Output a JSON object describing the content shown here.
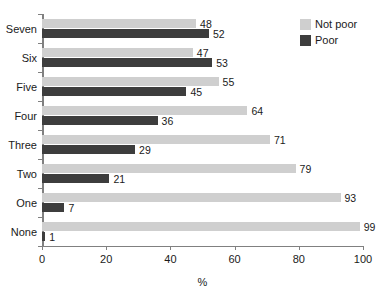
{
  "chart_data": {
    "type": "bar",
    "orientation": "horizontal",
    "title": "",
    "xlabel": "%",
    "ylabel": "",
    "xlim": [
      0,
      100
    ],
    "xticks": [
      0,
      20,
      40,
      60,
      80,
      100
    ],
    "grid": false,
    "legend_position": "top-right",
    "categories": [
      "Seven",
      "Six",
      "Five",
      "Four",
      "Three",
      "Two",
      "One",
      "None"
    ],
    "series": [
      {
        "name": "Not poor",
        "color": "#cfcfcf",
        "values": [
          48,
          47,
          55,
          64,
          71,
          79,
          93,
          99
        ]
      },
      {
        "name": "Poor",
        "color": "#3d3d3d",
        "values": [
          52,
          53,
          45,
          36,
          29,
          21,
          7,
          1
        ]
      }
    ]
  },
  "legend": {
    "entries": [
      {
        "label": "Not poor",
        "color": "#cfcfcf"
      },
      {
        "label": "Poor",
        "color": "#3d3d3d"
      }
    ]
  },
  "axis": {
    "x_title": "%",
    "x_tick_labels": [
      "0",
      "20",
      "40",
      "60",
      "80",
      "100"
    ],
    "axis_color": "#808080"
  }
}
